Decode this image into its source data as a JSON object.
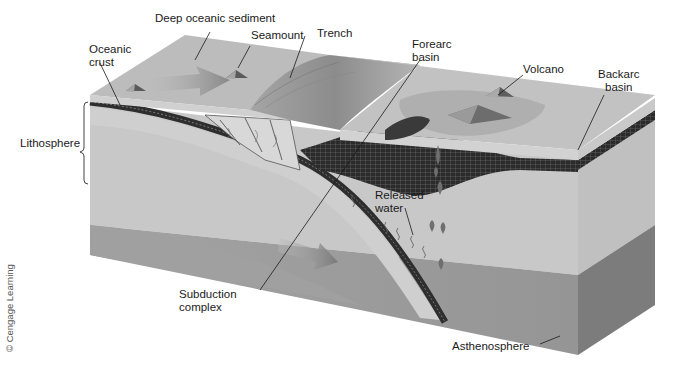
{
  "diagram": {
    "style": "grayscale 3D block diagram",
    "labels": {
      "deep_oceanic_sediment": "Deep oceanic sediment",
      "seamount": "Seamount",
      "trench": "Trench",
      "oceanic_crust_line1": "Oceanic",
      "oceanic_crust_line2": "crust",
      "forearc_basin_line1": "Forearc",
      "forearc_basin_line2": "basin",
      "volcano": "Volcano",
      "backarc_basin_line1": "Backarc",
      "backarc_basin_line2": "basin",
      "lithosphere": "Lithosphere",
      "released_water_line1": "Released",
      "released_water_line2": "water",
      "subduction_complex_line1": "Subduction",
      "subduction_complex_line2": "complex",
      "asthenosphere": "Asthenosphere"
    },
    "credit": "© Cengage Learning",
    "colors": {
      "ocean_surface": "#b9b9b9",
      "ocean_side": "#cfcfcf",
      "lithosphere": "#c6c6c6",
      "asthenosphere": "#9d9d9d",
      "asthenosphere_dark": "#7e7e7e",
      "crust_band": "#2e2e2e",
      "arrow": "#8a8a8a",
      "magma_drop": "#6f6f6f",
      "text": "#1a1a1a"
    }
  }
}
